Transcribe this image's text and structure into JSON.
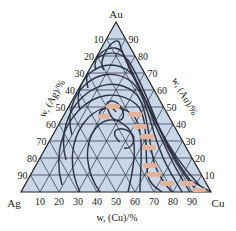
{
  "diagram": {
    "type": "ternary",
    "vertices": {
      "top": "Au",
      "left": "Ag",
      "right": "Cu"
    },
    "axes": {
      "left": {
        "label": "w, (Ag)/%",
        "ticks": [
          "10",
          "20",
          "30",
          "40",
          "50",
          "60",
          "70",
          "80",
          "90"
        ]
      },
      "right": {
        "label": "w, (Au)/%",
        "ticks": [
          "90",
          "80",
          "70",
          "60",
          "50",
          "40",
          "30",
          "20",
          "10"
        ]
      },
      "bottom": {
        "label": "w, (Cu)/%",
        "ticks": [
          "10",
          "20",
          "30",
          "40",
          "50",
          "60",
          "70",
          "80",
          "90"
        ]
      }
    },
    "colors": {
      "fill": "#c9d6e8",
      "grid": "#2a2f3a",
      "contour": "#2b3040",
      "value_label": "#d98a5a",
      "value_label_bg": "#e7b9a0"
    },
    "contour_value_labels_count": 12
  }
}
